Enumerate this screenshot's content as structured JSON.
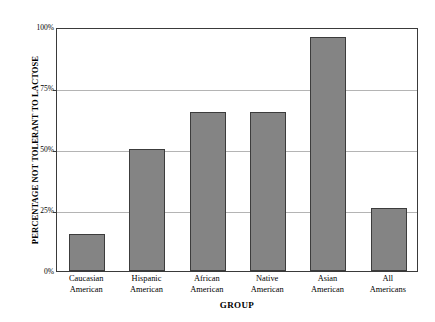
{
  "chart_data": {
    "type": "bar",
    "title": "",
    "xlabel": "GROUP",
    "ylabel": "PERCENTAGE NOT TOLERANT TO LACTOSE",
    "categories": [
      "Caucasian American",
      "Hispanic American",
      "African American",
      "Native American",
      "Asian American",
      "All Americans"
    ],
    "category_lines": [
      [
        "Caucasian",
        "American"
      ],
      [
        "Hispanic",
        "American"
      ],
      [
        "African",
        "American"
      ],
      [
        "Native",
        "American"
      ],
      [
        "Asian",
        "American"
      ],
      [
        "All",
        "Americans"
      ]
    ],
    "values": [
      15,
      50,
      65,
      65,
      96,
      26
    ],
    "ylim": [
      0,
      100
    ],
    "ytick_labels": [
      "0%",
      "25%",
      "50%",
      "75%",
      "100%"
    ],
    "ytick_values": [
      0,
      25,
      50,
      75,
      100
    ],
    "grid": true,
    "legend": "none",
    "bar_color": "#848484",
    "bar_border_color": "#3c3c3c",
    "gridline_color": "#b4b4b4",
    "axis_color": "#3a3a3a",
    "background_color": "#ffffff"
  }
}
